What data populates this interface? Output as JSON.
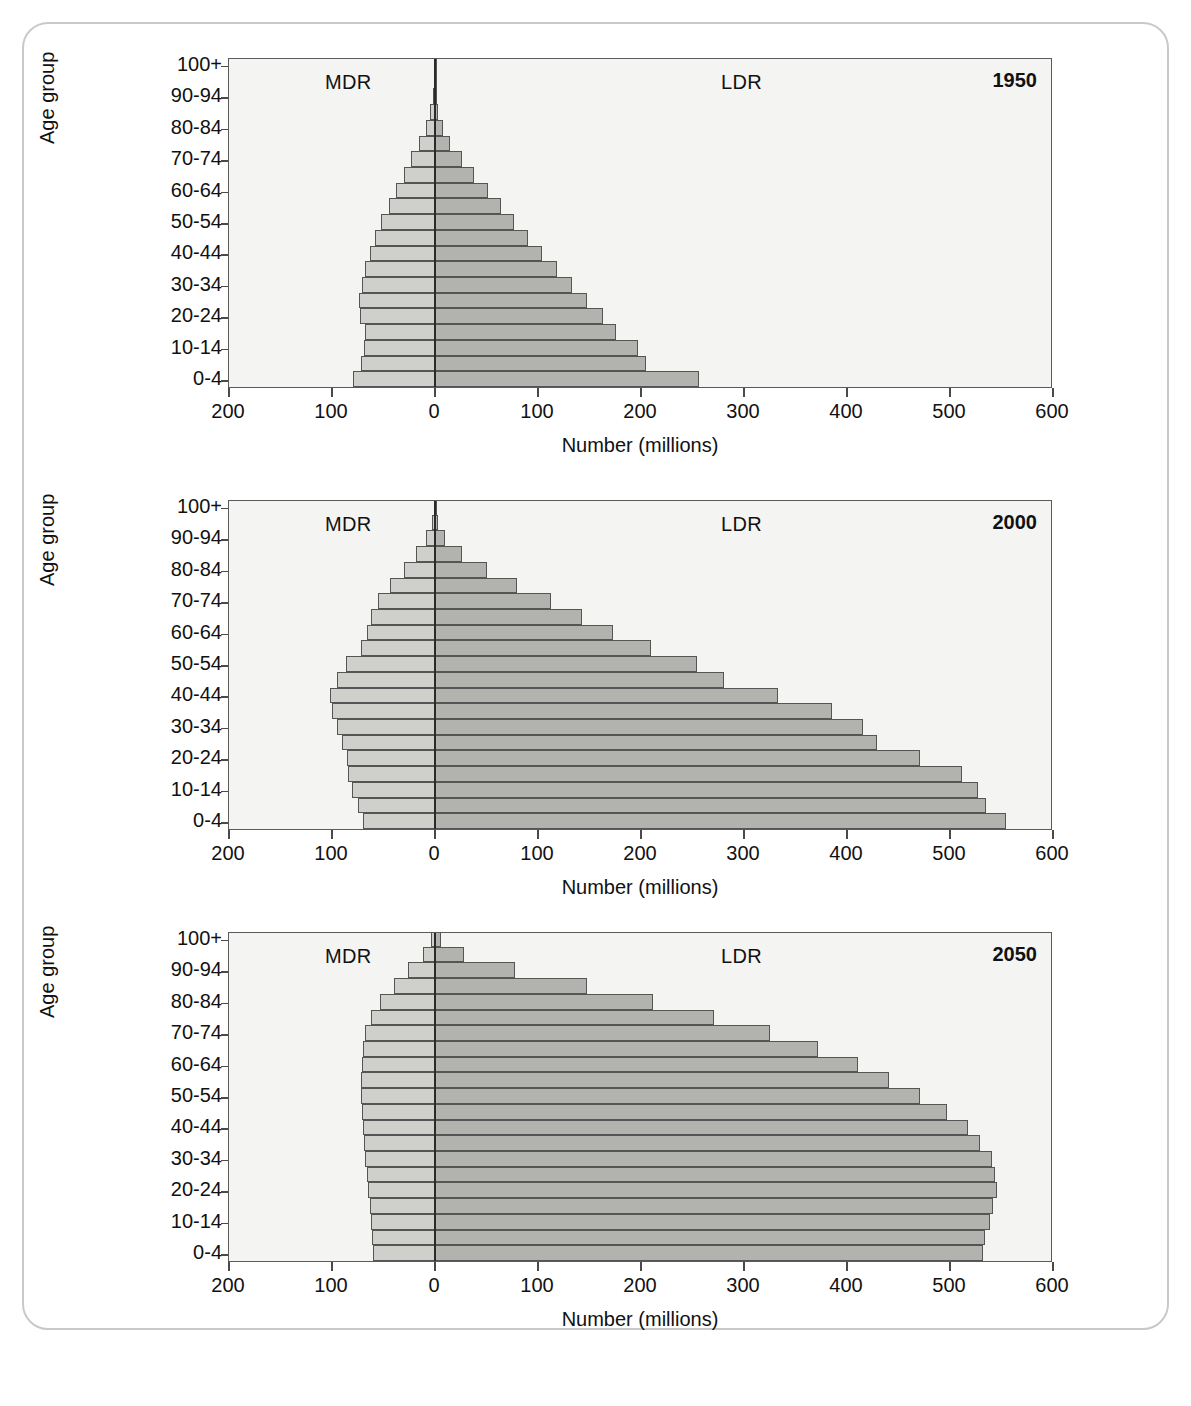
{
  "figure": {
    "y_axis_title": "Age group",
    "x_axis_title": "Number (millions)",
    "mdr_label": "MDR",
    "ldr_label": "LDR",
    "colors": {
      "mdr_fill": "#cfcfcb",
      "ldr_fill": "#b2b2ae",
      "bar_stroke": "#555555",
      "plot_background": "#f4f4f2",
      "axis": "#5a5a5a",
      "frame": "#c9c9c9"
    }
  },
  "chart_data": [
    {
      "type": "bar",
      "title": "1950",
      "subtitle": "",
      "xlabel": "Number (millions)",
      "ylabel": "Age group",
      "xlim": [
        -200,
        600
      ],
      "xticks": [
        -200,
        -100,
        0,
        100,
        200,
        300,
        400,
        500,
        600
      ],
      "xticklabels": [
        "200",
        "100",
        "0",
        "100",
        "200",
        "300",
        "400",
        "500",
        "600"
      ],
      "grid": false,
      "legend": [
        "MDR",
        "LDR"
      ],
      "legend_position": "in-plot",
      "categories": [
        "0-4",
        "5-9",
        "10-14",
        "15-19",
        "20-24",
        "25-29",
        "30-34",
        "35-39",
        "40-44",
        "45-49",
        "50-54",
        "55-59",
        "60-64",
        "65-69",
        "70-74",
        "75-79",
        "80-84",
        "85-89",
        "90-94",
        "95-99",
        "100+"
      ],
      "ytick_labels": [
        "0-4",
        "10-14",
        "20-24",
        "30-34",
        "40-44",
        "50-54",
        "60-64",
        "70-74",
        "80-84",
        "90-94",
        "100+"
      ],
      "series": [
        {
          "name": "MDR",
          "side": "left",
          "values": [
            80,
            72,
            69,
            68,
            73,
            74,
            71,
            68,
            63,
            58,
            52,
            45,
            38,
            30,
            23,
            16,
            9,
            4.5,
            1.6,
            0.4,
            0.1
          ]
        },
        {
          "name": "LDR",
          "side": "right",
          "values": [
            256,
            205,
            197,
            176,
            163,
            148,
            133,
            118,
            104,
            90,
            77,
            64,
            51,
            38,
            26,
            15,
            8,
            3.2,
            1.1,
            0.3,
            0.08
          ]
        }
      ]
    },
    {
      "type": "bar",
      "title": "2000",
      "subtitle": "",
      "xlabel": "Number (millions)",
      "ylabel": "Age group",
      "xlim": [
        -200,
        600
      ],
      "xticks": [
        -200,
        -100,
        0,
        100,
        200,
        300,
        400,
        500,
        600
      ],
      "xticklabels": [
        "200",
        "100",
        "0",
        "100",
        "200",
        "300",
        "400",
        "500",
        "600"
      ],
      "grid": false,
      "legend": [
        "MDR",
        "LDR"
      ],
      "legend_position": "in-plot",
      "categories": [
        "0-4",
        "5-9",
        "10-14",
        "15-19",
        "20-24",
        "25-29",
        "30-34",
        "35-39",
        "40-44",
        "45-49",
        "50-54",
        "55-59",
        "60-64",
        "65-69",
        "70-74",
        "75-79",
        "80-84",
        "85-89",
        "90-94",
        "95-99",
        "100+"
      ],
      "ytick_labels": [
        "0-4",
        "10-14",
        "20-24",
        "30-34",
        "40-44",
        "50-54",
        "60-64",
        "70-74",
        "80-84",
        "90-94",
        "100+"
      ],
      "series": [
        {
          "name": "MDR",
          "side": "left",
          "values": [
            70,
            75,
            81,
            84,
            85,
            90,
            95,
            100,
            102,
            95,
            86,
            72,
            66,
            62,
            55,
            44,
            30,
            18,
            8.5,
            2.6,
            0.6
          ]
        },
        {
          "name": "LDR",
          "side": "right",
          "values": [
            554,
            535,
            527,
            512,
            471,
            429,
            416,
            385,
            333,
            281,
            254,
            210,
            173,
            143,
            113,
            80,
            50,
            26,
            10,
            2.6,
            0.5
          ]
        }
      ]
    },
    {
      "type": "bar",
      "title": "2050",
      "subtitle": "",
      "xlabel": "Number (millions)",
      "ylabel": "Age group",
      "xlim": [
        -200,
        600
      ],
      "xticks": [
        -200,
        -100,
        0,
        100,
        200,
        300,
        400,
        500,
        600
      ],
      "xticklabels": [
        "200",
        "100",
        "0",
        "100",
        "200",
        "300",
        "400",
        "500",
        "600"
      ],
      "grid": false,
      "legend": [
        "MDR",
        "LDR"
      ],
      "legend_position": "in-plot",
      "categories": [
        "0-4",
        "5-9",
        "10-14",
        "15-19",
        "20-24",
        "25-29",
        "30-34",
        "35-39",
        "40-44",
        "45-49",
        "50-54",
        "55-59",
        "60-64",
        "65-69",
        "70-74",
        "75-79",
        "80-84",
        "85-89",
        "90-94",
        "95-99",
        "100+"
      ],
      "ytick_labels": [
        "0-4",
        "10-14",
        "20-24",
        "30-34",
        "40-44",
        "50-54",
        "60-64",
        "70-74",
        "80-84",
        "90-94",
        "100+"
      ],
      "series": [
        {
          "name": "MDR",
          "side": "left",
          "values": [
            60,
            61,
            62,
            63,
            65,
            66,
            68,
            69,
            70,
            71,
            72,
            72,
            71,
            70,
            68,
            62,
            53,
            40,
            26,
            12,
            4
          ]
        },
        {
          "name": "LDR",
          "side": "right",
          "values": [
            532,
            534,
            539,
            542,
            546,
            544,
            541,
            529,
            517,
            497,
            471,
            441,
            411,
            372,
            325,
            271,
            212,
            148,
            78,
            28,
            6
          ]
        }
      ]
    }
  ]
}
